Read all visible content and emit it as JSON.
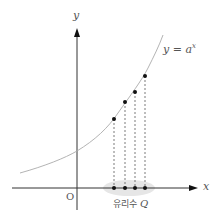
{
  "diagram": {
    "y_axis_label": "y",
    "x_axis_label": "x",
    "origin_label": "O",
    "curve_label": "y = a",
    "curve_label_exponent": "x",
    "set_label_korean": "유리수",
    "set_label_symbol": "Q",
    "colors": {
      "axis": "#333333",
      "curve": "#aaaaaa",
      "points": "#111111",
      "dashes": "#444444",
      "highlight": "#e6e6e6"
    },
    "points_on_x_axis": [
      114,
      125,
      135,
      145
    ],
    "points_on_curve_y": [
      119,
      102,
      92,
      76
    ]
  }
}
